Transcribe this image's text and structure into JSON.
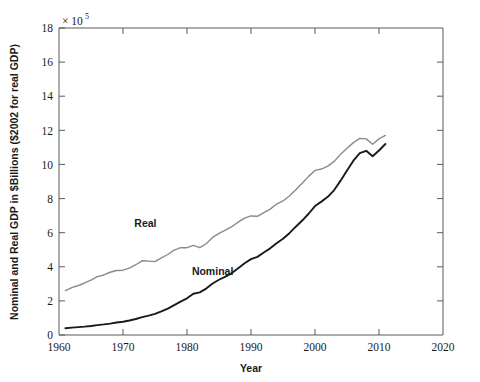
{
  "chart_data": {
    "type": "line",
    "title": "",
    "xlabel": "Year",
    "ylabel": "Nominal and Real GDP in $Billions ($2002 for real GDP)",
    "y_exponent_label": "× 10",
    "y_exponent_power": "5",
    "xlim": [
      1960,
      2020
    ],
    "ylim": [
      0,
      18
    ],
    "xticks": [
      1960,
      1970,
      1980,
      1990,
      2000,
      2010,
      2020
    ],
    "xtick_labels": [
      "1960",
      "1970",
      "1980",
      "1990",
      "2000",
      "2010",
      "2020"
    ],
    "yticks": [
      0,
      2,
      4,
      6,
      8,
      10,
      12,
      14,
      16,
      18
    ],
    "ytick_labels": [
      "0",
      "2",
      "4",
      "6",
      "8",
      "10",
      "12",
      "14",
      "16",
      "18"
    ],
    "grid": false,
    "legend_position": "inline-annotations",
    "colors": {
      "nominal": "#1a1a1a",
      "real": "#8a8a8a",
      "axis": "#5a5a5a",
      "background": "#ffffff"
    },
    "annotations": [
      {
        "text": "Real",
        "x": 1973.5,
        "y": 6.35
      },
      {
        "text": "Nominal",
        "x": 1984.0,
        "y": 3.55
      }
    ],
    "x": [
      1961,
      1962,
      1963,
      1964,
      1965,
      1966,
      1967,
      1968,
      1969,
      1970,
      1971,
      1972,
      1973,
      1974,
      1975,
      1976,
      1977,
      1978,
      1979,
      1980,
      1981,
      1982,
      1983,
      1984,
      1985,
      1986,
      1987,
      1988,
      1989,
      1990,
      1991,
      1992,
      1993,
      1994,
      1995,
      1996,
      1997,
      1998,
      1999,
      2000,
      2001,
      2002,
      2003,
      2004,
      2005,
      2006,
      2007,
      2008,
      2009,
      2010,
      2011
    ],
    "series": [
      {
        "name": "Nominal",
        "color": "#1a1a1a",
        "values": [
          0.4,
          0.43,
          0.46,
          0.49,
          0.53,
          0.58,
          0.62,
          0.67,
          0.73,
          0.78,
          0.85,
          0.94,
          1.05,
          1.14,
          1.24,
          1.39,
          1.55,
          1.75,
          1.96,
          2.15,
          2.42,
          2.5,
          2.72,
          3.02,
          3.24,
          3.42,
          3.63,
          3.92,
          4.21,
          4.45,
          4.58,
          4.84,
          5.08,
          5.38,
          5.64,
          5.97,
          6.35,
          6.71,
          7.11,
          7.56,
          7.82,
          8.1,
          8.5,
          9.05,
          9.65,
          10.22,
          10.66,
          10.8,
          10.48,
          10.82,
          11.2
        ],
        "values_display_scale": "×10^5 $Billions, reading axis units",
        "axis_values": [
          0.4,
          0.43,
          0.46,
          0.49,
          0.53,
          0.58,
          0.62,
          0.67,
          0.73,
          0.78,
          0.85,
          0.94,
          1.05,
          1.14,
          1.24,
          1.39,
          1.55,
          1.75,
          1.96,
          2.15,
          2.42,
          2.5,
          2.72,
          3.02,
          3.24,
          3.42,
          3.63,
          3.92,
          4.21,
          4.45,
          4.58,
          4.84,
          5.08,
          5.38,
          5.64,
          5.97,
          6.35,
          6.71,
          7.11,
          7.56,
          7.82,
          8.1,
          8.5,
          9.05,
          9.65,
          10.22,
          10.66,
          10.8,
          10.48,
          10.82,
          11.2
        ]
      },
      {
        "name": "Real",
        "color": "#8a8a8a",
        "values": [
          2.6,
          2.78,
          2.9,
          3.05,
          3.22,
          3.42,
          3.52,
          3.68,
          3.78,
          3.8,
          3.92,
          4.12,
          4.35,
          4.33,
          4.3,
          4.52,
          4.72,
          4.98,
          5.12,
          5.12,
          5.25,
          5.12,
          5.35,
          5.72,
          5.96,
          6.15,
          6.35,
          6.62,
          6.85,
          6.98,
          6.96,
          7.18,
          7.38,
          7.68,
          7.86,
          8.15,
          8.52,
          8.9,
          9.3,
          9.65,
          9.73,
          9.9,
          10.18,
          10.6,
          10.95,
          11.28,
          11.53,
          11.5,
          11.18,
          11.5,
          11.7
        ]
      }
    ]
  },
  "axis_titles": {
    "x": "Year",
    "y": "Nominal and Real GDP in $Billions ($2002 for real GDP)"
  }
}
